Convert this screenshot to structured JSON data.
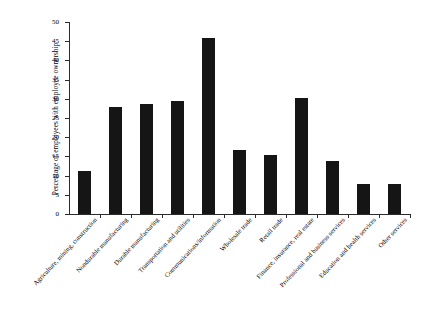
{
  "chart_data": {
    "type": "bar",
    "title": "",
    "xlabel": "",
    "ylabel": "Percentage of employees with employee ownership",
    "ylim": [
      0,
      50
    ],
    "ytick_step": 5,
    "ytick_labels": [
      "0",
      "5",
      "10",
      "15",
      "20",
      "25",
      "30",
      "35",
      "40",
      "45",
      "50"
    ],
    "grid": false,
    "legend": false,
    "bar_color": "#151515",
    "categories": [
      "Agriculture, mining, construction",
      "Nondurable manufacturing",
      "Durable manufacturing",
      "Transportation and utilities",
      "Communications/information",
      "Wholesale trade",
      "Retail trade",
      "Finance, insurance, real estate",
      "Professional and business services",
      "Education and health services",
      "Other services"
    ],
    "values": [
      11.2,
      27.9,
      28.6,
      29.4,
      45.8,
      16.7,
      15.4,
      30.2,
      13.8,
      7.8,
      7.8
    ]
  }
}
